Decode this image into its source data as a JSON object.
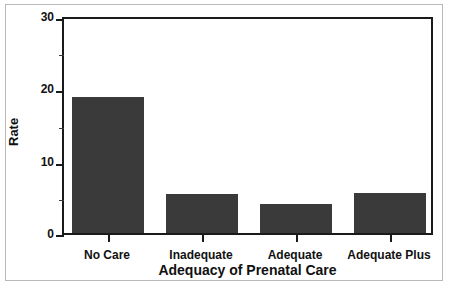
{
  "chart_data": {
    "type": "bar",
    "title": "",
    "xlabel": "Adequacy of Prenatal Care",
    "ylabel": "Rate",
    "categories": [
      "No Care",
      "Inadequate",
      "Adequate",
      "Adequate Plus"
    ],
    "values": [
      19.0,
      5.4,
      4.1,
      5.6
    ],
    "ylim": [
      0,
      30
    ],
    "y_major_ticks": [
      0,
      10,
      20,
      30
    ],
    "y_minor_ticks": [
      5,
      15,
      25
    ],
    "y_tick_labels": [
      "0",
      "10",
      "20",
      "30"
    ],
    "grid": false,
    "legend": null,
    "bar_color": "#3a3a3a",
    "axis_color": "#1a1a1a",
    "frame_color": "#b9b9b9",
    "background": "#ffffff"
  },
  "axes": {
    "y_title": "Rate",
    "x_title": "Adequacy of Prenatal Care",
    "y_labels": {
      "t0": "0",
      "t10": "10",
      "t20": "20",
      "t30": "30"
    },
    "x_labels": {
      "c0": "No Care",
      "c1": "Inadequate",
      "c2": "Adequate",
      "c3": "Adequate Plus"
    }
  }
}
